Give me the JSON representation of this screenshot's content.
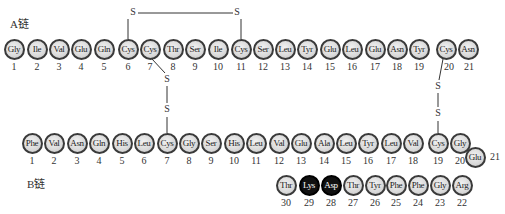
{
  "a_chain": {
    "label": "A链",
    "residues": [
      "Gly",
      "Ile",
      "Val",
      "Glu",
      "Gln",
      "Cys",
      "Cys",
      "Thr",
      "Ser",
      "Ile",
      "Cys",
      "Ser",
      "Leu",
      "Tyr",
      "Glu",
      "Leu",
      "Glu",
      "Asn",
      "Tyr",
      "Cys",
      "Asn"
    ],
    "numbers": [
      "1",
      "2",
      "3",
      "4",
      "5",
      "6",
      "7",
      "8",
      "9",
      "10",
      "11",
      "12",
      "13",
      "14",
      "15",
      "16",
      "17",
      "18",
      "19",
      "20",
      "21"
    ]
  },
  "b_chain": {
    "label": "B链",
    "residues": [
      "Phe",
      "Val",
      "Asn",
      "Gln",
      "His",
      "Leu",
      "Cys",
      "Gly",
      "Ser",
      "His",
      "Leu",
      "Val",
      "Glu",
      "Ala",
      "Leu",
      "Tyr",
      "Leu",
      "Val",
      "Cys",
      "Gly",
      "Glu",
      "Arg",
      "Gly",
      "Phe",
      "Phe",
      "Tyr",
      "Thr",
      "Asp",
      "Lys",
      "Thr"
    ],
    "numbers": [
      "1",
      "2",
      "3",
      "4",
      "5",
      "6",
      "7",
      "8",
      "9",
      "10",
      "11",
      "12",
      "13",
      "14",
      "15",
      "16",
      "17",
      "18",
      "19",
      "20",
      "21",
      "22",
      "23",
      "24",
      "25",
      "26",
      "27",
      "28",
      "29",
      "30"
    ],
    "highlighted": [
      "28",
      "29"
    ]
  },
  "disulfide": {
    "s_label": "S",
    "bonds": [
      "A6-A11",
      "A7-B7",
      "A20-B19"
    ]
  },
  "colors": {
    "residue_fill": "#d9d9d9",
    "residue_border": "#3a3a3a",
    "highlight_fill": "#111111"
  }
}
